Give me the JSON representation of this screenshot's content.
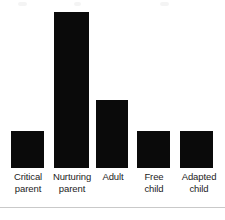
{
  "figure": {
    "background_color": "#ffffff",
    "bar_color": "#0a0a0a",
    "label_color": "#1c1c1c",
    "rule_color": "#c9c9c9",
    "baseline_y": 168
  },
  "chart_data": {
    "type": "bar",
    "title": "",
    "subtitle": "",
    "xlabel": "",
    "ylabel": "",
    "grid": false,
    "legend": false,
    "axis_visible": false,
    "ylim": [
      0,
      160
    ],
    "categories": [
      "Critical\nparent",
      "Nurturing\nparent",
      "Adult",
      "Free\nchild",
      "Adapted\nchild"
    ],
    "values": [
      37,
      156,
      68,
      37,
      37
    ],
    "bars": [
      {
        "label": "Critical\nparent",
        "value": 37,
        "x": 11,
        "width": 33,
        "top": 131
      },
      {
        "label": "Nurturing\nparent",
        "value": 156,
        "x": 54,
        "width": 35,
        "top": 12
      },
      {
        "label": "Adult",
        "value": 68,
        "x": 96,
        "width": 32,
        "top": 100
      },
      {
        "label": "Free\nchild",
        "value": 37,
        "x": 137,
        "width": 33,
        "top": 131
      },
      {
        "label": "Adapted\nchild",
        "value": 37,
        "x": 180,
        "width": 33,
        "top": 131
      }
    ],
    "label_slots": [
      {
        "left": 4,
        "width": 48
      },
      {
        "left": 46,
        "width": 52
      },
      {
        "left": 94,
        "width": 38
      },
      {
        "left": 132,
        "width": 44
      },
      {
        "left": 174,
        "width": 50
      }
    ]
  }
}
